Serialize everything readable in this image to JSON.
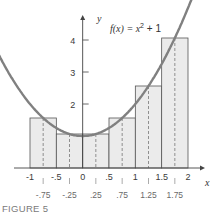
{
  "chart_data": {
    "type": "bar",
    "function": "f(x) = x^2 + 1",
    "xlabel": "x",
    "ylabel": "y",
    "xlim": [
      -1,
      2
    ],
    "ylim": [
      0,
      4.6
    ],
    "grid": false,
    "legend": null,
    "x_tick_labels": [
      "-1",
      "-.5",
      "0",
      ".5",
      "1",
      "1.5",
      "2"
    ],
    "x_ticks": [
      -1,
      -0.5,
      0,
      0.5,
      1,
      1.5,
      2
    ],
    "y_tick_labels": [
      "2",
      "3",
      "4"
    ],
    "y_ticks": [
      2,
      3,
      4
    ],
    "midpoint_labels": [
      "-.75",
      "-.25",
      ".25",
      ".75",
      "1.25",
      "1.75"
    ],
    "categories": [
      "[-1,-.5]",
      "[-.5,0]",
      "[0,.5]",
      "[.5,1]",
      "[1,1.5]",
      "[1.5,2]"
    ],
    "bar_intervals": [
      [
        -1,
        -0.5
      ],
      [
        -0.5,
        0
      ],
      [
        0,
        0.5
      ],
      [
        0.5,
        1
      ],
      [
        1,
        1.5
      ],
      [
        1.5,
        2
      ]
    ],
    "midpoints": [
      -0.75,
      -0.25,
      0.25,
      0.75,
      1.25,
      1.75
    ],
    "values": [
      1.5625,
      1.0625,
      1.0625,
      1.5625,
      2.5625,
      4.0625
    ],
    "annotation": "Midpoint Riemann sum: rectangle heights f(midpoint), dashed lines at midpoints"
  },
  "labels": {
    "function_label_prefix": "f(x) = x",
    "function_label_exp": "2",
    "function_label_suffix": " + 1",
    "x_axis": "x",
    "y_axis": "y",
    "caption": "FIGURE 5"
  },
  "colors": {
    "bar_fill": "#ebebeb",
    "bar_stroke": "#555555",
    "curve": "#808080",
    "axis": "#444444"
  }
}
